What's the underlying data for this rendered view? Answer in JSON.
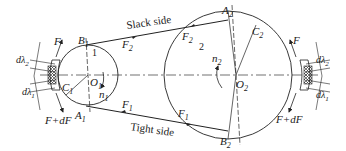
{
  "diagram": {
    "pulley_small": {
      "number": "1",
      "center": "O",
      "center_sub": "1",
      "speed": "n",
      "speed_sub": "1",
      "point_top": "B",
      "point_top_sub": "1",
      "point_bottom": "A",
      "point_bottom_sub": "1",
      "point_c": "C",
      "point_c_sub": "1"
    },
    "pulley_large": {
      "number": "2",
      "center": "O",
      "center_sub": "2",
      "speed": "n",
      "speed_sub": "2",
      "point_top": "A",
      "point_top_sub": "2",
      "point_bottom": "B",
      "point_bottom_sub": "2",
      "point_c": "C",
      "point_c_sub": "2"
    },
    "belt": {
      "slack_label": "Slack side",
      "tight_label": "Tight side",
      "slack_force": "F",
      "slack_force_sub": "2",
      "tight_force": "F",
      "tight_force_sub": "1"
    },
    "element_left": {
      "force_top": "F",
      "force_bottom": "F+dF",
      "elong_top": "dλ",
      "elong_top_sub": "2",
      "elong_bottom": "dλ",
      "elong_bottom_sub": "1"
    },
    "element_right": {
      "force_top": "F",
      "force_bottom": "F+dF",
      "elong_top": "dλ",
      "elong_top_sub": "2",
      "elong_bottom": "dλ",
      "elong_bottom_sub": "1"
    },
    "colors": {
      "line": "#222222",
      "background": "#ffffff"
    }
  }
}
